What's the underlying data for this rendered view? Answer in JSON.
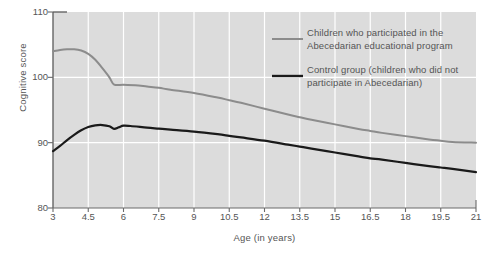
{
  "chart_data": {
    "type": "line",
    "title": "",
    "xlabel": "Age (in years)",
    "ylabel": "Cognitive score",
    "xlim": [
      3,
      21
    ],
    "ylim": [
      80,
      110
    ],
    "grid": true,
    "grid_color": "#ffffff",
    "plot_background": "#dcdcdc",
    "legend_position": "upper-right-inside",
    "x_ticks": [
      "3",
      "4.5",
      "6",
      "7.5",
      "9",
      "10.5",
      "12",
      "13.5",
      "15",
      "16.5",
      "18",
      "19.5",
      "21"
    ],
    "x_tick_values": [
      3,
      4.5,
      6,
      7.5,
      9,
      10.5,
      12,
      13.5,
      15,
      16.5,
      18,
      19.5,
      21
    ],
    "y_ticks": [
      "80",
      "90",
      "100",
      "110"
    ],
    "y_tick_values": [
      80,
      90,
      100,
      110
    ],
    "series": [
      {
        "name": "Children who participated in the\nAbecedarian educational program",
        "color": "#8c8c8c",
        "width": 2.0,
        "x": [
          3,
          3.3,
          3.6,
          3.9,
          4.2,
          4.5,
          4.8,
          5.1,
          5.4,
          5.6,
          6,
          6.5,
          7,
          7.5,
          8,
          9,
          10,
          10.5,
          11,
          12,
          13,
          13.5,
          14,
          15,
          16,
          16.5,
          17,
          18,
          19,
          19.5,
          20,
          21
        ],
        "y": [
          104.0,
          104.2,
          104.3,
          104.3,
          104.1,
          103.6,
          102.7,
          101.4,
          100.0,
          98.9,
          98.85,
          98.8,
          98.6,
          98.4,
          98.1,
          97.6,
          96.9,
          96.5,
          96.1,
          95.2,
          94.3,
          93.9,
          93.5,
          92.8,
          92.1,
          91.8,
          91.5,
          91.0,
          90.5,
          90.3,
          90.1,
          90.0
        ]
      },
      {
        "name": "Control group (children who did not\nparticipate in Abecedarian)",
        "color": "#1a1a1a",
        "width": 2.2,
        "x": [
          3,
          3.3,
          3.6,
          3.9,
          4.2,
          4.5,
          4.8,
          5.1,
          5.4,
          5.6,
          5.8,
          6,
          6.3,
          7,
          7.5,
          8,
          9,
          10,
          10.5,
          11,
          12,
          13,
          13.5,
          14,
          15,
          16,
          16.5,
          17,
          18,
          19,
          19.5,
          20,
          21
        ],
        "y": [
          88.7,
          89.5,
          90.4,
          91.2,
          91.9,
          92.4,
          92.65,
          92.7,
          92.5,
          92.1,
          92.35,
          92.6,
          92.55,
          92.3,
          92.15,
          92.0,
          91.7,
          91.3,
          91.05,
          90.8,
          90.3,
          89.7,
          89.4,
          89.1,
          88.5,
          87.9,
          87.6,
          87.4,
          86.9,
          86.4,
          86.2,
          86.0,
          85.5
        ]
      }
    ],
    "legend_entries": [
      {
        "label": "Children who participated in the\nAbecedarian educational program",
        "color": "#8c8c8c"
      },
      {
        "label": "Control group (children who did not\nparticipate in Abecedarian)",
        "color": "#1a1a1a"
      }
    ]
  }
}
